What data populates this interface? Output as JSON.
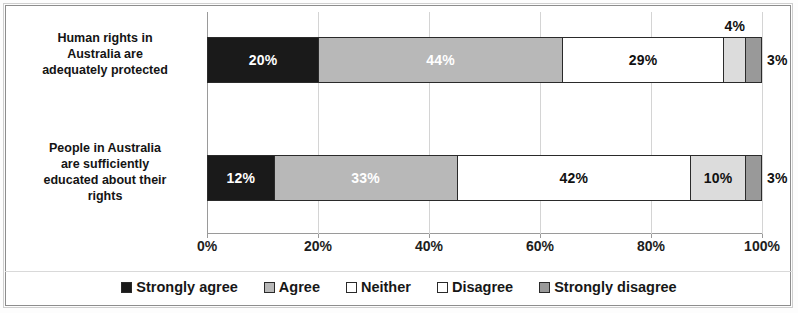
{
  "chart_data": {
    "type": "bar",
    "orientation": "horizontal",
    "stacked": true,
    "title": "",
    "xlabel": "",
    "ylabel": "",
    "xlim": [
      0,
      100
    ],
    "xticks": [
      "0%",
      "20%",
      "40%",
      "60%",
      "80%",
      "100%"
    ],
    "grid": true,
    "legend_position": "bottom",
    "categories": [
      "Human rights in Australia are adequately protected",
      "People in Australia are sufficiently educated about their rights"
    ],
    "series": [
      {
        "name": "Strongly agree",
        "color": "#1a1a1a",
        "values": [
          20,
          12
        ],
        "labels": [
          "20%",
          "12%"
        ]
      },
      {
        "name": "Agree",
        "color": "#b8b8b8",
        "values": [
          44,
          33
        ],
        "labels": [
          "44%",
          "33%"
        ]
      },
      {
        "name": "Neither",
        "color": "#ffffff",
        "values": [
          29,
          42
        ],
        "labels": [
          "29%",
          "42%"
        ]
      },
      {
        "name": "Disagree",
        "color": "#dcdcdc",
        "values": [
          4,
          10
        ],
        "labels": [
          "4%",
          "10%"
        ]
      },
      {
        "name": "Strongly disagree",
        "color": "#999999",
        "values": [
          3,
          3
        ],
        "labels": [
          "3%",
          "3%"
        ]
      }
    ]
  },
  "bars": [
    {
      "category": "Human rights in Australia are adequately protected",
      "segments": [
        {
          "series": "Strongly agree",
          "value": 20,
          "label": "20%",
          "color": "#1a1a1a",
          "text_color": "#ffffff",
          "label_placement": "inside"
        },
        {
          "series": "Agree",
          "value": 44,
          "label": "44%",
          "color": "#b8b8b8",
          "text_color": "#ffffff",
          "label_placement": "inside"
        },
        {
          "series": "Neither",
          "value": 29,
          "label": "29%",
          "color": "#ffffff",
          "text_color": "#111111",
          "label_placement": "inside"
        },
        {
          "series": "Disagree",
          "value": 4,
          "label": "4%",
          "color": "#dcdcdc",
          "text_color": "#111111",
          "label_placement": "above"
        },
        {
          "series": "Strongly disagree",
          "value": 3,
          "label": "3%",
          "color": "#999999",
          "text_color": "#111111",
          "label_placement": "outside"
        }
      ]
    },
    {
      "category": "People in Australia are sufficiently educated about their rights",
      "segments": [
        {
          "series": "Strongly agree",
          "value": 12,
          "label": "12%",
          "color": "#1a1a1a",
          "text_color": "#ffffff",
          "label_placement": "inside"
        },
        {
          "series": "Agree",
          "value": 33,
          "label": "33%",
          "color": "#b8b8b8",
          "text_color": "#ffffff",
          "label_placement": "inside"
        },
        {
          "series": "Neither",
          "value": 42,
          "label": "42%",
          "color": "#ffffff",
          "text_color": "#111111",
          "label_placement": "inside"
        },
        {
          "series": "Disagree",
          "value": 10,
          "label": "10%",
          "color": "#dcdcdc",
          "text_color": "#111111",
          "label_placement": "inside"
        },
        {
          "series": "Strongly disagree",
          "value": 3,
          "label": "3%",
          "color": "#999999",
          "text_color": "#111111",
          "label_placement": "outside"
        }
      ]
    }
  ],
  "category_labels": [
    {
      "lines": [
        "Human rights in",
        "Australia are",
        "adequately protected"
      ]
    },
    {
      "lines": [
        "People in Australia",
        "are sufficiently",
        "educated about their",
        "rights"
      ]
    }
  ],
  "xticks": [
    {
      "label": "0%",
      "value": 0
    },
    {
      "label": "20%",
      "value": 20
    },
    {
      "label": "40%",
      "value": 40
    },
    {
      "label": "60%",
      "value": 60
    },
    {
      "label": "80%",
      "value": 80
    },
    {
      "label": "100%",
      "value": 100
    }
  ],
  "legend": [
    {
      "label": "Strongly agree",
      "color": "#1a1a1a"
    },
    {
      "label": "Agree",
      "color": "#b8b8b8"
    },
    {
      "label": "Neither",
      "color": "#ffffff"
    },
    {
      "label": "Disagree",
      "color": "#ffffff"
    },
    {
      "label": "Strongly disagree",
      "color": "#999999"
    }
  ]
}
